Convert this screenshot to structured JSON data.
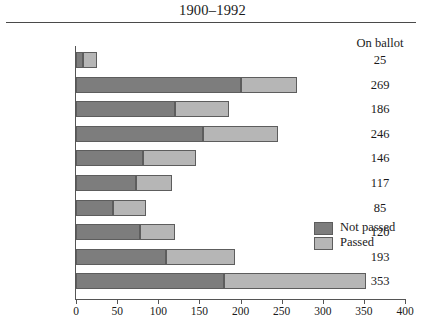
{
  "header": {
    "supertitle": "",
    "title": "1900–1992",
    "value_column_header": "On ballot"
  },
  "legend": {
    "position": "inside-middle-right",
    "items": [
      {
        "label": "Not passed",
        "color": "#7d7d7d"
      },
      {
        "label": "Passed",
        "color": "#b6b6b6"
      }
    ]
  },
  "axis": {
    "x_ticks": [
      "0",
      "50",
      "100",
      "150",
      "200",
      "250",
      "300",
      "350",
      "400"
    ]
  },
  "chart_data": {
    "type": "bar",
    "orientation": "horizontal",
    "stacked": true,
    "title": "1900–1992",
    "xlabel": "",
    "ylabel": "",
    "xlim": [
      0,
      400
    ],
    "grid": false,
    "legend_position": "inside-middle-right",
    "categories": [
      "1900–9",
      "1910–19",
      "1920–29",
      "1930–39",
      "1940–49",
      "1950–59",
      "1960–69",
      "1970–79",
      "1980–89",
      "1990–99*"
    ],
    "series": [
      {
        "name": "Not passed",
        "color": "#7d7d7d",
        "values": [
          8,
          200,
          120,
          155,
          82,
          73,
          45,
          78,
          110,
          180
        ]
      },
      {
        "name": "Passed",
        "color": "#b6b6b6",
        "values": [
          17,
          69,
          66,
          91,
          64,
          44,
          40,
          42,
          83,
          173
        ]
      }
    ],
    "totals_label": "On ballot",
    "totals": [
      25,
      269,
      186,
      246,
      146,
      117,
      85,
      120,
      193,
      353
    ]
  }
}
